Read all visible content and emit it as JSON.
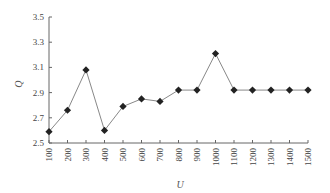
{
  "chart_data": {
    "type": "line",
    "title": "",
    "xlabel": "U",
    "ylabel": "Q",
    "categories": [
      "100",
      "200",
      "300",
      "400",
      "500",
      "600",
      "700",
      "800",
      "900",
      "1000",
      "1100",
      "1200",
      "1300",
      "1400",
      "1500"
    ],
    "series": [
      {
        "name": "Q",
        "marker": "diamond",
        "values": [
          2.59,
          2.76,
          3.08,
          2.6,
          2.79,
          2.85,
          2.83,
          2.92,
          2.92,
          3.21,
          2.92,
          2.92,
          2.92,
          2.92,
          2.92
        ]
      }
    ],
    "yticks": [
      "2.5",
      "2.7",
      "2.9",
      "3.1",
      "3.3",
      "3.5"
    ],
    "ylim": [
      2.5,
      3.5
    ],
    "grid": false,
    "legend": "none",
    "colors": {
      "line": "#888888",
      "marker": "#222222",
      "axis": "#666666"
    }
  }
}
